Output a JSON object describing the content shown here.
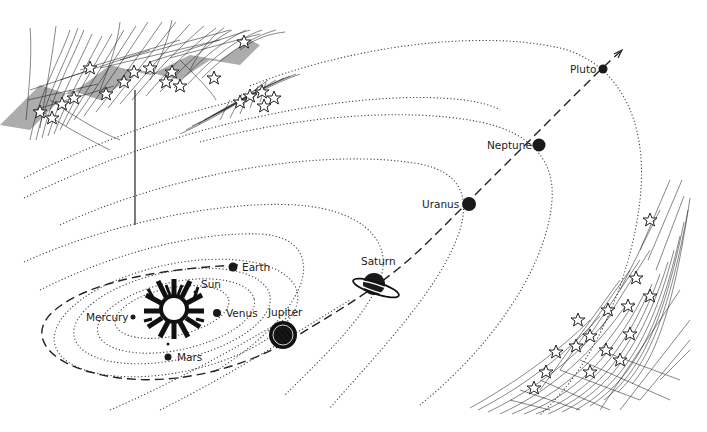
{
  "diagram": {
    "colors": {
      "ink": "#1a1a1a",
      "background": "#ffffff"
    },
    "labels": {
      "sun": "Sun",
      "mercury": "Mercury",
      "venus": "Venus",
      "earth": "Earth",
      "mars": "Mars",
      "jupiter": "Jupiter",
      "saturn": "Saturn",
      "uranus": "Uranus",
      "neptune": "Neptune",
      "pluto": "Pluto"
    },
    "decorations": [
      "star-field-upper-left",
      "star-field-small-upper-middle",
      "star-field-lower-right"
    ],
    "trajectory": "dashed-path-with-arrow-toward-pluto"
  }
}
